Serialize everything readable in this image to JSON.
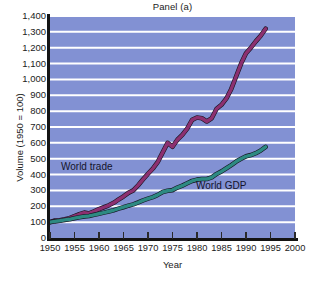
{
  "chart_data": {
    "type": "line",
    "title": "Panel (a)",
    "xlabel": "Year",
    "ylabel": "Volume (1950 = 100)",
    "xlim": [
      1950,
      2000
    ],
    "ylim": [
      0,
      1400
    ],
    "grid": true,
    "grid_axis": "y",
    "legend_position": "inline-annotations",
    "plot_background": "#8291d3",
    "gridline_color": "#ffffff",
    "y_ticks": [
      0,
      100,
      200,
      300,
      400,
      500,
      600,
      700,
      800,
      900,
      1000,
      1100,
      1200,
      1300,
      1400
    ],
    "y_tick_labels": [
      "0",
      "100",
      "200",
      "300",
      "400",
      "500",
      "600",
      "700",
      "800",
      "900",
      "1,000",
      "1,100",
      "1,200",
      "1,300",
      "1,400"
    ],
    "x_ticks": [
      1950,
      1955,
      1960,
      1965,
      1970,
      1975,
      1980,
      1985,
      1990,
      1995,
      2000
    ],
    "x_tick_labels": [
      "1950",
      "1955",
      "1960",
      "1965",
      "1970",
      "1975",
      "1980",
      "1985",
      "1990",
      "1995",
      "2000"
    ],
    "series": [
      {
        "name": "World trade",
        "color": "#8c3070",
        "label_position": {
          "x": 1952.5,
          "y": 455
        },
        "x": [
          1950,
          1951,
          1952,
          1953,
          1954,
          1955,
          1956,
          1957,
          1958,
          1959,
          1960,
          1961,
          1962,
          1963,
          1964,
          1965,
          1966,
          1967,
          1968,
          1969,
          1970,
          1971,
          1972,
          1973,
          1974,
          1975,
          1976,
          1977,
          1978,
          1979,
          1980,
          1981,
          1982,
          1983,
          1984,
          1985,
          1986,
          1987,
          1988,
          1989,
          1990,
          1991,
          1992,
          1993,
          1994
        ],
        "y": [
          100,
          110,
          112,
          118,
          125,
          138,
          150,
          160,
          155,
          168,
          182,
          194,
          206,
          222,
          243,
          262,
          285,
          300,
          333,
          370,
          405,
          438,
          480,
          540,
          600,
          575,
          620,
          650,
          690,
          745,
          760,
          755,
          735,
          755,
          815,
          840,
          880,
          940,
          1020,
          1100,
          1165,
          1200,
          1240,
          1275,
          1320
        ]
      },
      {
        "name": "World GDP",
        "color": "#2d8a82",
        "label_position": {
          "x": 1982,
          "y": 345
        },
        "x": [
          1950,
          1951,
          1952,
          1953,
          1954,
          1955,
          1956,
          1957,
          1958,
          1959,
          1960,
          1961,
          1962,
          1963,
          1964,
          1965,
          1966,
          1967,
          1968,
          1969,
          1970,
          1971,
          1972,
          1973,
          1974,
          1975,
          1976,
          1977,
          1978,
          1979,
          1980,
          1981,
          1982,
          1983,
          1984,
          1985,
          1986,
          1987,
          1988,
          1989,
          1990,
          1991,
          1992,
          1993,
          1994
        ],
        "y": [
          100,
          105,
          109,
          114,
          118,
          125,
          131,
          136,
          139,
          146,
          153,
          160,
          167,
          175,
          185,
          194,
          204,
          212,
          224,
          237,
          248,
          258,
          272,
          290,
          298,
          302,
          318,
          330,
          345,
          360,
          368,
          372,
          372,
          382,
          404,
          420,
          440,
          460,
          482,
          500,
          515,
          523,
          535,
          552,
          575
        ]
      }
    ],
    "annotations": [
      {
        "text": "World trade",
        "series": "World trade"
      },
      {
        "text": "World GDP",
        "series": "World GDP"
      }
    ]
  }
}
